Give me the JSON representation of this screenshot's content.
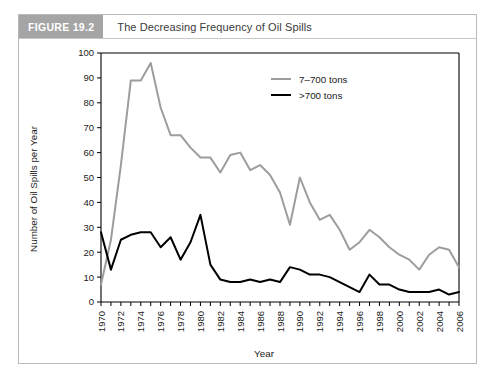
{
  "figure": {
    "badge": "FIGURE 19.2",
    "title": "The Decreasing Frequency of Oil Spills"
  },
  "colors": {
    "series_7_700": "#9d9d9d",
    "series_gt700": "#000000",
    "badge_bg": "#a5a5a5",
    "border": "#b9b9b9"
  },
  "chart_data": {
    "type": "line",
    "title": "The Decreasing Frequency of Oil Spills",
    "xlabel": "Year",
    "ylabel": "Number of Oil Spills per Year",
    "xlim": [
      1970,
      2006
    ],
    "ylim": [
      0,
      100
    ],
    "ytick_step": 10,
    "xtick_step_minor": 1,
    "xtick_step_labeled": 2,
    "grid": false,
    "legend_position": "top-right",
    "yticks": [
      0,
      10,
      20,
      30,
      40,
      50,
      60,
      70,
      80,
      90,
      100
    ],
    "xticks_labeled": [
      "1970",
      "1972",
      "1974",
      "1976",
      "1978",
      "1980",
      "1982",
      "1984",
      "1986",
      "1988",
      "1990",
      "1992",
      "1994",
      "1996",
      "1998",
      "2000",
      "2002",
      "2004",
      "2006"
    ],
    "x": [
      1970,
      1971,
      1972,
      1973,
      1974,
      1975,
      1976,
      1977,
      1978,
      1979,
      1980,
      1981,
      1982,
      1983,
      1984,
      1985,
      1986,
      1987,
      1988,
      1989,
      1990,
      1991,
      1992,
      1993,
      1994,
      1995,
      1996,
      1997,
      1998,
      1999,
      2000,
      2001,
      2002,
      2003,
      2004,
      2005,
      2006
    ],
    "series": [
      {
        "name": "7–700 tons",
        "color": "#9d9d9d",
        "values": [
          7,
          25,
          55,
          89,
          89,
          96,
          78,
          67,
          67,
          62,
          58,
          58,
          52,
          59,
          60,
          53,
          55,
          51,
          44,
          31,
          50,
          40,
          33,
          35,
          29,
          21,
          24,
          29,
          26,
          22,
          19,
          17,
          13,
          19,
          22,
          21,
          14
        ]
      },
      {
        "name": ">700 tons",
        "color": "#000000",
        "values": [
          28,
          13,
          25,
          27,
          28,
          28,
          22,
          26,
          17,
          24,
          35,
          15,
          9,
          8,
          8,
          9,
          8,
          9,
          8,
          14,
          13,
          11,
          11,
          10,
          8,
          6,
          4,
          11,
          7,
          7,
          5,
          4,
          4,
          4,
          5,
          3,
          4
        ]
      }
    ]
  },
  "legend": {
    "items": [
      {
        "label": "7–700 tons",
        "color": "#9d9d9d"
      },
      {
        "label": ">700 tons",
        "color": "#000000"
      }
    ]
  },
  "axes": {
    "x_title": "Year",
    "y_title": "Number of Oil Spills per Year"
  }
}
